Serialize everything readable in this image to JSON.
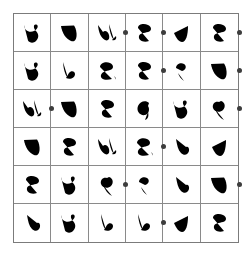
{
  "puzzle": {
    "title": "Handwritten Glyph Grid",
    "rows": 6,
    "columns": 6,
    "grid_line_color": "#8a8a8a",
    "grid_border_color": "#7b7b7b",
    "glyph_color": "#d8d8d8",
    "dot_color": "#3d3d3d",
    "background_color": "#ffffff",
    "cells": [
      [
        {
          "glyph_name": "glyph-ye-loop",
          "glyph_id": "g-ye-loop"
        },
        {
          "glyph_name": "glyph-nun-hook",
          "glyph_id": "g-nun-hook"
        },
        {
          "glyph_name": "glyph-lam-alef",
          "glyph_id": "g-lam-alef"
        },
        {
          "glyph_name": "glyph-sad-curl",
          "glyph_id": "g-sad-curl"
        },
        {
          "glyph_name": "glyph-vee-stroke",
          "glyph_id": "g-vee-stroke"
        },
        {
          "glyph_name": "glyph-sad-curl",
          "glyph_id": "g-sad-curl"
        }
      ],
      [
        {
          "glyph_name": "glyph-ye-loop",
          "glyph_id": "g-ye-loop"
        },
        {
          "glyph_name": "glyph-lam-tail",
          "glyph_id": "g-lam-tail"
        },
        {
          "glyph_name": "glyph-ain-curl",
          "glyph_id": "g-ain-curl"
        },
        {
          "glyph_name": "glyph-sad-curl",
          "glyph_id": "g-sad-curl"
        },
        {
          "glyph_name": "glyph-hamza-tick",
          "glyph_id": "g-hamza-tick"
        },
        {
          "glyph_name": "glyph-nun-hook",
          "glyph_id": "g-nun-hook"
        }
      ],
      [
        {
          "glyph_name": "glyph-lam-alef",
          "glyph_id": "g-lam-alef"
        },
        {
          "glyph_name": "glyph-nun-hook",
          "glyph_id": "g-nun-hook"
        },
        {
          "glyph_name": "glyph-sad-curl",
          "glyph_id": "g-sad-curl"
        },
        {
          "glyph_name": "glyph-dal-round",
          "glyph_id": "g-dal-round"
        },
        {
          "glyph_name": "glyph-ye-loop",
          "glyph_id": "g-ye-loop"
        },
        {
          "glyph_name": "glyph-fe-ring",
          "glyph_id": "g-fe-ring"
        }
      ],
      [
        {
          "glyph_name": "glyph-nun-hook",
          "glyph_id": "g-nun-hook"
        },
        {
          "glyph_name": "glyph-sad-curl",
          "glyph_id": "g-sad-curl"
        },
        {
          "glyph_name": "glyph-lam-alef",
          "glyph_id": "g-lam-alef"
        },
        {
          "glyph_name": "glyph-ain-curl",
          "glyph_id": "g-ain-curl"
        },
        {
          "glyph_name": "glyph-reh-swoop",
          "glyph_id": "g-reh-swoop"
        },
        {
          "glyph_name": "glyph-vee-stroke",
          "glyph_id": "g-vee-stroke"
        }
      ],
      [
        {
          "glyph_name": "glyph-sad-curl",
          "glyph_id": "g-sad-curl"
        },
        {
          "glyph_name": "glyph-ye-loop",
          "glyph_id": "g-ye-loop"
        },
        {
          "glyph_name": "glyph-fe-ring",
          "glyph_id": "g-fe-ring"
        },
        {
          "glyph_name": "glyph-hamza-tick",
          "glyph_id": "g-hamza-tick"
        },
        {
          "glyph_name": "glyph-reh-swoop",
          "glyph_id": "g-reh-swoop"
        },
        {
          "glyph_name": "glyph-nun-hook",
          "glyph_id": "g-nun-hook"
        }
      ],
      [
        {
          "glyph_name": "glyph-reh-swoop",
          "glyph_id": "g-reh-swoop"
        },
        {
          "glyph_name": "glyph-ye-loop",
          "glyph_id": "g-ye-loop"
        },
        {
          "glyph_name": "glyph-lam-tail",
          "glyph_id": "g-lam-tail"
        },
        {
          "glyph_name": "glyph-lam-tail",
          "glyph_id": "g-lam-tail"
        },
        {
          "glyph_name": "glyph-vee-stroke",
          "glyph_id": "g-vee-stroke"
        },
        {
          "glyph_name": "glyph-sad-curl",
          "glyph_id": "g-sad-curl"
        }
      ]
    ],
    "dots": [
      {
        "label": "dot-r1-c3-right",
        "row": 1,
        "after_column": 3,
        "x": 125,
        "y": 32
      },
      {
        "label": "dot-r1-c4-right",
        "row": 1,
        "after_column": 4,
        "x": 163,
        "y": 32
      },
      {
        "label": "dot-r1-c6-right",
        "row": 1,
        "after_column": 6,
        "x": 239,
        "y": 32
      },
      {
        "label": "dot-r2-c4-right",
        "row": 2,
        "after_column": 4,
        "x": 163,
        "y": 70
      },
      {
        "label": "dot-r2-c6-right",
        "row": 2,
        "after_column": 6,
        "x": 239,
        "y": 70
      },
      {
        "label": "dot-r3-c1-right",
        "row": 3,
        "after_column": 1,
        "x": 51,
        "y": 108
      },
      {
        "label": "dot-r3-c6-right",
        "row": 3,
        "after_column": 6,
        "x": 239,
        "y": 108
      },
      {
        "label": "dot-r4-c4-right",
        "row": 4,
        "after_column": 4,
        "x": 163,
        "y": 146
      },
      {
        "label": "dot-r5-c3-right",
        "row": 5,
        "after_column": 3,
        "x": 125,
        "y": 184
      },
      {
        "label": "dot-r5-c6-right",
        "row": 5,
        "after_column": 6,
        "x": 239,
        "y": 184
      },
      {
        "label": "dot-r6-c4-right",
        "row": 6,
        "after_column": 4,
        "x": 163,
        "y": 222
      }
    ]
  }
}
